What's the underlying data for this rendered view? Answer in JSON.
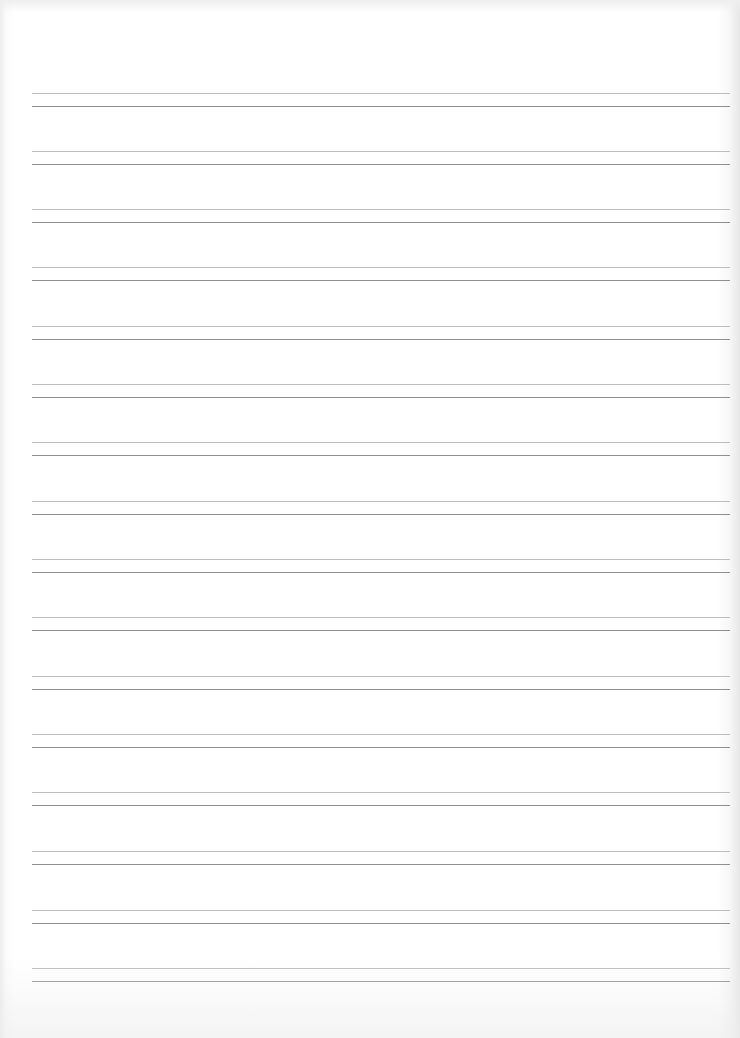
{
  "document": {
    "type": "lined-paper",
    "background_color": "#ffffff",
    "rule_colors": {
      "top_line": "#bdbdbd",
      "bottom_line": "#8f8f8f"
    },
    "rule_pairs": [
      {
        "y": 93
      },
      {
        "y": 151
      },
      {
        "y": 209
      },
      {
        "y": 267
      },
      {
        "y": 326
      },
      {
        "y": 384
      },
      {
        "y": 442
      },
      {
        "y": 501
      },
      {
        "y": 559
      },
      {
        "y": 617
      },
      {
        "y": 676
      },
      {
        "y": 734
      },
      {
        "y": 792
      },
      {
        "y": 851
      },
      {
        "y": 910
      },
      {
        "y": 968
      }
    ]
  }
}
